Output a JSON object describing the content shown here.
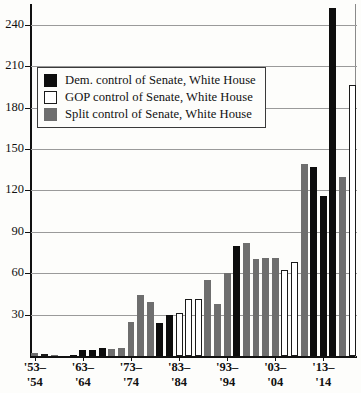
{
  "chart_data": {
    "type": "bar",
    "title": "",
    "subtitle": "",
    "xlabel": "",
    "ylabel": "",
    "ylim": [
      0,
      255
    ],
    "grid": true,
    "legend_position": "upper-left",
    "y_ticks": [
      30,
      60,
      90,
      120,
      150,
      180,
      210,
      240
    ],
    "x_tick_labels": [
      {
        "line1": "'53–",
        "line2": "'54"
      },
      {
        "line1": "'63–",
        "line2": "'64"
      },
      {
        "line1": "'73–",
        "line2": "'74"
      },
      {
        "line1": "'83–",
        "line2": "'84"
      },
      {
        "line1": "'93–",
        "line2": "'94"
      },
      {
        "line1": "'03–",
        "line2": "'04"
      },
      {
        "line1": "'13–",
        "line2": "'14"
      }
    ],
    "categories": [
      "'53-'54",
      "'55-'56",
      "'57-'58",
      "'59-'60",
      "'61-'62",
      "'63-'64",
      "'65-'66",
      "'67-'68",
      "'69-'70",
      "'71-'72",
      "'73-'74",
      "'75-'76",
      "'77-'78",
      "'79-'80",
      "'81-'82",
      "'83-'84",
      "'85-'86",
      "'87-'88",
      "'89-'90",
      "'91-'92",
      "'93-'94",
      "'95-'96",
      "'97-'98",
      "'99-'00",
      "'01-'02",
      "'03-'04",
      "'05-'06",
      "'07-'08",
      "'09-'10",
      "'11-'12",
      "'13-'14",
      "'15-'16"
    ],
    "values": [
      2,
      0,
      0,
      0,
      0,
      4,
      5,
      7,
      6,
      7,
      25,
      44,
      39,
      24,
      30,
      31,
      41,
      41,
      55,
      38,
      60,
      80,
      82,
      70,
      71,
      71,
      62,
      68,
      139,
      137,
      116,
      252
    ],
    "control": [
      "split",
      "gop",
      "gop",
      "gop",
      "dem",
      "dem",
      "dem",
      "dem",
      "split",
      "split",
      "split",
      "split",
      "split",
      "dem",
      "dem",
      "gop",
      "gop",
      "gop",
      "split",
      "split",
      "split",
      "dem",
      "split",
      "split",
      "split",
      "gop",
      "gop",
      "split",
      "split",
      "dem",
      "dem",
      "dem"
    ],
    "series": [
      {
        "name": "Dem. control of Senate, White House",
        "color": "#0d0d0d",
        "key": "dem"
      },
      {
        "name": "GOP control of Senate, White House",
        "color": "#ffffff",
        "key": "gop"
      },
      {
        "name": "Split control of Senate, White House",
        "color": "#6e6e6e",
        "key": "split"
      }
    ],
    "bars": [
      {
        "value": 2,
        "control": "split"
      },
      {
        "value": 1,
        "control": "gop"
      },
      {
        "value": 1,
        "control": "split"
      },
      {
        "value": 0,
        "control": "split"
      },
      {
        "value": 1,
        "control": "dem"
      },
      {
        "value": 4,
        "control": "dem"
      },
      {
        "value": 4,
        "control": "dem"
      },
      {
        "value": 6,
        "control": "dem"
      },
      {
        "value": 5,
        "control": "split"
      },
      {
        "value": 6,
        "control": "split"
      },
      {
        "value": 25,
        "control": "split"
      },
      {
        "value": 44,
        "control": "split"
      },
      {
        "value": 39,
        "control": "split"
      },
      {
        "value": 24,
        "control": "dem"
      },
      {
        "value": 30,
        "control": "dem"
      },
      {
        "value": 31,
        "control": "gop"
      },
      {
        "value": 41,
        "control": "gop"
      },
      {
        "value": 41,
        "control": "gop"
      },
      {
        "value": 55,
        "control": "split"
      },
      {
        "value": 38,
        "control": "split"
      },
      {
        "value": 60,
        "control": "split"
      },
      {
        "value": 80,
        "control": "dem"
      },
      {
        "value": 82,
        "control": "split"
      },
      {
        "value": 70,
        "control": "split"
      },
      {
        "value": 71,
        "control": "split"
      },
      {
        "value": 71,
        "control": "split"
      },
      {
        "value": 62,
        "control": "gop"
      },
      {
        "value": 68,
        "control": "gop"
      },
      {
        "value": 139,
        "control": "split"
      },
      {
        "value": 137,
        "control": "dem"
      },
      {
        "value": 116,
        "control": "dem"
      },
      {
        "value": 252,
        "control": "dem"
      },
      {
        "value": 130,
        "control": "split"
      },
      {
        "value": 196,
        "control": "gop"
      }
    ]
  },
  "legend": {
    "items": [
      {
        "label": "Dem. control of Senate, White House",
        "key": "dem"
      },
      {
        "label": "GOP control of Senate, White House",
        "key": "gop"
      },
      {
        "label": "Split control of Senate, White House",
        "key": "split"
      }
    ]
  }
}
